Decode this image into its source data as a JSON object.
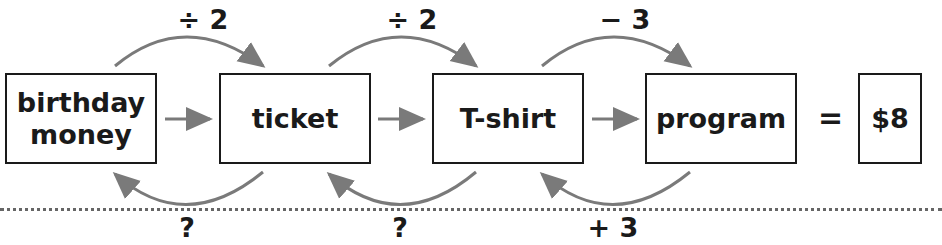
{
  "diagram": {
    "boxes": [
      {
        "id": "birthday-money",
        "line1": "birthday",
        "line2": "money"
      },
      {
        "id": "ticket",
        "label": "ticket"
      },
      {
        "id": "t-shirt",
        "label": "T-shirt"
      },
      {
        "id": "program",
        "label": "program"
      },
      {
        "id": "result",
        "label": "$8"
      }
    ],
    "equals": "=",
    "forward_ops": [
      "÷ 2",
      "÷ 2",
      "− 3"
    ],
    "inverse_ops": [
      "?",
      "?",
      "+ 3"
    ],
    "colors": {
      "arrow": "#7a7a7a",
      "box_border": "#1a1a1a",
      "text": "#1a1a1a"
    }
  }
}
